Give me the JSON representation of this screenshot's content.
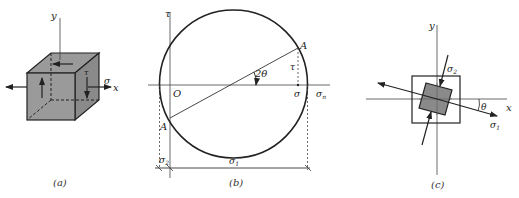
{
  "figure": {
    "panels": [
      {
        "id": "a",
        "caption": "(a)",
        "labels": {
          "y_axis": "y",
          "x_axis": "x",
          "normal_stress": "σ",
          "shear_stress": "τ"
        }
      },
      {
        "id": "b",
        "caption": "(b)",
        "labels": {
          "tau_axis": "τ",
          "sigma_n_axis": "σn",
          "sigma_n_base": "σ",
          "sigma_n_sub": "n",
          "origin": "O",
          "point_A": "A",
          "point_A_prime": "A",
          "angle": "2θ",
          "tau": "τ",
          "sigma": "σ",
          "sigma_1": "σ",
          "sigma_1_sub": "1",
          "sigma_2": "σ",
          "sigma_2_sub": "2"
        }
      },
      {
        "id": "c",
        "caption": "(c)",
        "labels": {
          "y_axis": "y",
          "x_axis": "x",
          "angle": "θ",
          "sigma_1": "σ",
          "sigma_1_sub": "1",
          "sigma_2": "σ",
          "sigma_2_sub": "2"
        }
      }
    ]
  },
  "colors": {
    "ink": "#222222",
    "fill": "#8c8c8c",
    "background": "#ffffff"
  }
}
